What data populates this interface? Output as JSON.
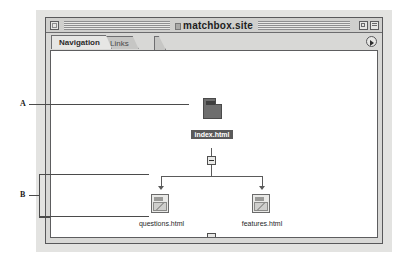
{
  "window": {
    "title": "matchbox.site",
    "close_label": "close",
    "zoom_label": "zoom",
    "collapse_label": "collapse"
  },
  "tabs": [
    {
      "label": "Navigation",
      "active": true
    },
    {
      "label": "Links",
      "active": false
    }
  ],
  "tab_popup": {
    "icon": "triangle-right-icon"
  },
  "tree": {
    "root": {
      "label": "index.html",
      "selected": true,
      "icon": "page-icon-selected"
    },
    "children": [
      {
        "label": "questions.html",
        "icon": "page-icon"
      },
      {
        "label": "features.html",
        "icon": "page-icon"
      }
    ],
    "toggles": [
      {
        "name": "root-collapse-toggle",
        "state": "collapse"
      },
      {
        "name": "branch-collapse-toggle",
        "state": "collapse"
      }
    ]
  },
  "annotations": [
    {
      "label": "A",
      "target": "index.html node"
    },
    {
      "label": "B",
      "target": "child nodes group"
    }
  ],
  "colors": {
    "window_chrome": "#d8d8d6",
    "titlebar": "#cfcfcd",
    "canvas": "#ffffff",
    "selection": "#5a5a5a",
    "line": "#5a5a5a",
    "backdrop": "#e3e3e1"
  }
}
